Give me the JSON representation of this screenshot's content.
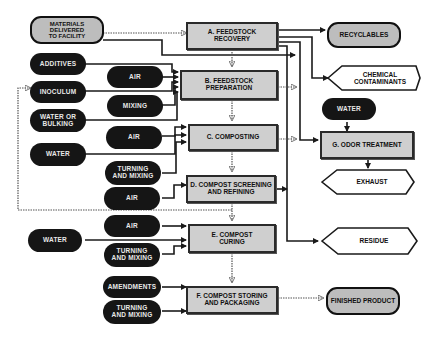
{
  "diagram": {
    "type": "process-flow",
    "colors": {
      "input_pill": "#151515",
      "process_fill": "#cfcfcf",
      "line": "#1a1a1a",
      "dotted_line": "#555555"
    },
    "source": {
      "label": "MATERIALS\nDELIVERED\nTO FACILITY"
    },
    "processes": [
      {
        "id": "A",
        "label": "A. FEEDSTOCK\nRECOVERY"
      },
      {
        "id": "B",
        "label": "B. FEEDSTOCK\nPREPARATION"
      },
      {
        "id": "C",
        "label": "C. COMPOSTING"
      },
      {
        "id": "D",
        "label": "D. COMPOST SCREENING\nAND REFINING"
      },
      {
        "id": "E",
        "label": "E. COMPOST\nCURING"
      },
      {
        "id": "F",
        "label": "F. COMPOST STORING\nAND PACKAGING"
      },
      {
        "id": "G",
        "label": "G. ODOR TREATMENT"
      }
    ],
    "inputs": {
      "additives": "ADDITIVES",
      "inoculum": "INOCULUM",
      "water_or_bulking": "WATER OR\nBULKING",
      "water_c": "WATER",
      "air_b": "AIR",
      "mixing_b": "MIXING",
      "air_c": "AIR",
      "turning_mixing_c": "TURNING\nAND MIXING",
      "air_d": "AIR",
      "air_e": "AIR",
      "water_e": "WATER",
      "turning_mixing_e": "TURNING\nAND MIXING",
      "amendments": "AMENDMENTS",
      "turning_mixing_f": "TURNING\nAND MIXING",
      "water_g": "WATER"
    },
    "outputs": {
      "recyclables": "RECYCLABLES",
      "chemical_contaminants": "CHEMICAL\nCONTAMINANTS",
      "exhaust": "EXHAUST",
      "residue": "RESIDUE",
      "finished_product": "FINISHED PRODUCT"
    }
  }
}
